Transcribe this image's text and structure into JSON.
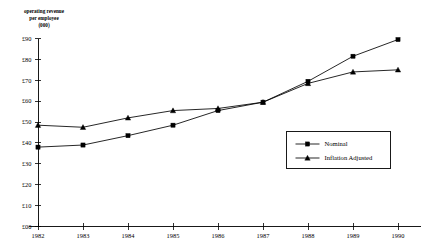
{
  "chart_data": {
    "type": "line",
    "title": "",
    "axis_title_lines": [
      "operating revenue",
      "per employee",
      "(000)"
    ],
    "xlabel": "",
    "ylabel": "operating revenue per employee (000)",
    "categories": [
      "1982",
      "1983",
      "1984",
      "1985",
      "1986",
      "1987",
      "1988",
      "1989",
      "1990"
    ],
    "x": [
      1982,
      1983,
      1984,
      1985,
      1986,
      1987,
      1988,
      1989,
      1990
    ],
    "series": [
      {
        "name": "Nominal",
        "marker": "square",
        "values": [
          38.0,
          39.0,
          43.5,
          48.5,
          55.5,
          59.5,
          69.5,
          81.5,
          89.5
        ]
      },
      {
        "name": "Inflation Adjusted",
        "marker": "triangle",
        "values": [
          48.5,
          47.5,
          52.0,
          55.5,
          56.5,
          59.5,
          68.5,
          74.0,
          75.0
        ]
      }
    ],
    "ylim": [
      0,
      90
    ],
    "ytick_values": [
      0,
      10,
      20,
      30,
      40,
      50,
      60,
      70,
      80,
      90
    ],
    "ytick_labels": [
      "£00",
      "£10",
      "£20",
      "£30",
      "£40",
      "£50",
      "£60",
      "£70",
      "£80",
      "£90"
    ],
    "grid": false,
    "legend_position": "center-right",
    "legend_entries": [
      "Nominal",
      "Inflation Adjusted"
    ],
    "colors": {
      "line": "#000000",
      "marker": "#000000",
      "axis": "#000000",
      "background": "#ffffff"
    }
  }
}
